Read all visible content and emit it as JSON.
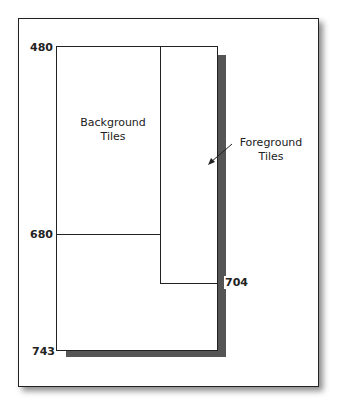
{
  "diagram": {
    "labels": {
      "top": "480",
      "middle": "680",
      "foreground_bottom": "704",
      "bottom": "743"
    },
    "regions": {
      "background": {
        "line1": "Background",
        "line2": "Tiles"
      },
      "foreground": {
        "line1": "Foreground",
        "line2": "Tiles"
      }
    },
    "colors": {
      "stroke": "#222222",
      "shadow": "#555555",
      "fill": "#ffffff"
    }
  }
}
